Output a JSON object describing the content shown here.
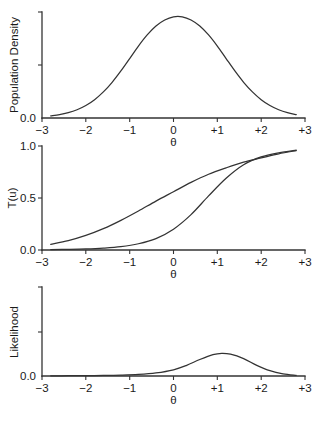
{
  "figure": {
    "background": "#ffffff",
    "line_color": "#333333",
    "panel_count": 3
  },
  "chart_data": [
    {
      "type": "line",
      "panel": "top",
      "title": "",
      "xlabel": "θ",
      "ylabel": "Population Density",
      "xlim": [
        -3,
        3
      ],
      "ylim": [
        0,
        1
      ],
      "grid": false,
      "legend": "none",
      "xticks": [
        -3,
        -2,
        -1,
        0,
        1,
        2,
        3
      ],
      "xticklabels": [
        "−3",
        "−2",
        "−1",
        "0",
        "+1",
        "+2",
        "+3"
      ],
      "yticks": [
        0
      ],
      "yticklabels": [
        "0.0"
      ],
      "series": [
        {
          "name": "population density",
          "x": [
            -2.8,
            -2.6,
            -2.4,
            -2.2,
            -2.0,
            -1.8,
            -1.6,
            -1.4,
            -1.2,
            -1.0,
            -0.8,
            -0.6,
            -0.4,
            -0.2,
            0.0,
            0.2,
            0.4,
            0.6,
            0.8,
            1.0,
            1.2,
            1.4,
            1.6,
            1.8,
            2.0,
            2.2,
            2.4,
            2.6,
            2.8
          ],
          "y": [
            0.019,
            0.031,
            0.05,
            0.078,
            0.118,
            0.173,
            0.246,
            0.337,
            0.444,
            0.561,
            0.679,
            0.784,
            0.868,
            0.925,
            0.955,
            0.955,
            0.925,
            0.868,
            0.784,
            0.679,
            0.561,
            0.444,
            0.337,
            0.246,
            0.173,
            0.118,
            0.078,
            0.05,
            0.031
          ]
        }
      ]
    },
    {
      "type": "line",
      "panel": "middle",
      "title": "",
      "xlabel": "θ",
      "ylabel": "T(u)",
      "xlim": [
        -3,
        3
      ],
      "ylim": [
        0,
        1
      ],
      "grid": false,
      "legend": "none",
      "xticks": [
        -3,
        -2,
        -1,
        0,
        1,
        2,
        3
      ],
      "xticklabels": [
        "−3",
        "−2",
        "−1",
        "0",
        "+1",
        "+2",
        "+3"
      ],
      "yticks": [
        0,
        0.5,
        1
      ],
      "yticklabels": [
        "0.0",
        "0.5",
        "1.0"
      ],
      "series": [
        {
          "name": "shallow transformation curve",
          "x": [
            -2.8,
            -2.4,
            -2.0,
            -1.6,
            -1.2,
            -0.8,
            -0.4,
            0.0,
            0.4,
            0.8,
            1.2,
            1.6,
            2.0,
            2.4,
            2.8
          ],
          "y": [
            0.055,
            0.09,
            0.14,
            0.205,
            0.285,
            0.375,
            0.47,
            0.56,
            0.65,
            0.728,
            0.79,
            0.845,
            0.885,
            0.925,
            0.955
          ]
        },
        {
          "name": "steep transformation curve",
          "x": [
            -2.8,
            -2.4,
            -2.0,
            -1.6,
            -1.2,
            -0.8,
            -0.4,
            0.0,
            0.4,
            0.8,
            1.2,
            1.6,
            2.0,
            2.4,
            2.8
          ],
          "y": [
            0.004,
            0.006,
            0.01,
            0.018,
            0.032,
            0.06,
            0.11,
            0.2,
            0.34,
            0.52,
            0.69,
            0.82,
            0.895,
            0.935,
            0.96
          ]
        }
      ]
    },
    {
      "type": "line",
      "panel": "bottom",
      "title": "",
      "xlabel": "θ",
      "ylabel": "Likelihood",
      "xlim": [
        -3,
        3
      ],
      "ylim": [
        0,
        1
      ],
      "grid": false,
      "legend": "none",
      "xticks": [
        -3,
        -2,
        -1,
        0,
        1,
        2,
        3
      ],
      "xticklabels": [
        "−3",
        "−2",
        "−1",
        "0",
        "+1",
        "+2",
        "+3"
      ],
      "yticks": [
        0
      ],
      "yticklabels": [
        "0.0"
      ],
      "series": [
        {
          "name": "likelihood",
          "x": [
            -2.8,
            -2.4,
            -2.0,
            -1.6,
            -1.2,
            -0.8,
            -0.4,
            0.0,
            0.3,
            0.6,
            0.9,
            1.1,
            1.3,
            1.6,
            1.9,
            2.2,
            2.5,
            2.8
          ],
          "y": [
            0.002,
            0.003,
            0.004,
            0.006,
            0.01,
            0.018,
            0.035,
            0.07,
            0.12,
            0.185,
            0.24,
            0.255,
            0.245,
            0.195,
            0.12,
            0.06,
            0.025,
            0.008
          ]
        }
      ]
    }
  ],
  "panels": {
    "density": {
      "ylabel": "Population Density",
      "xlabel": "θ",
      "ytick_0": "0.0",
      "xticklabels": [
        "−3",
        "−2",
        "−1",
        "0",
        "+1",
        "+2",
        "+3"
      ]
    },
    "transform": {
      "ylabel": "T(u)",
      "xlabel": "θ",
      "ytick_0": "0.0",
      "ytick_1": "0.5",
      "ytick_2": "1.0",
      "xticklabels": [
        "−3",
        "−2",
        "−1",
        "0",
        "+1",
        "+2",
        "+3"
      ]
    },
    "likelihood": {
      "ylabel": "Likelihood",
      "xlabel": "θ",
      "ytick_0": "0.0",
      "xticklabels": [
        "−3",
        "−2",
        "−1",
        "0",
        "+1",
        "+2",
        "+3"
      ]
    }
  }
}
